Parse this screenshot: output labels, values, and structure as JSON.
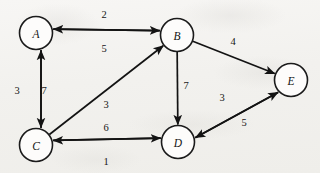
{
  "figure": {
    "background_color": "#f2f1ee",
    "ink_color": "#131313",
    "node_fill": "#fdfcfb"
  },
  "chart_data": {
    "type": "diagram",
    "diagram_kind": "directed-weighted-graph",
    "title": "",
    "directed": true,
    "weighted": true,
    "node_radius": 16.5,
    "nodes": [
      {
        "id": "A",
        "label": "A",
        "x": 36,
        "y": 33
      },
      {
        "id": "B",
        "label": "B",
        "x": 177,
        "y": 35
      },
      {
        "id": "C",
        "label": "C",
        "x": 36,
        "y": 145
      },
      {
        "id": "D",
        "label": "D",
        "x": 178,
        "y": 142
      },
      {
        "id": "E",
        "label": "E",
        "x": 291,
        "y": 80
      }
    ],
    "edges": [
      {
        "from": "A",
        "to": "B",
        "weight": 2,
        "label_x": 104,
        "label_y": 14
      },
      {
        "from": "B",
        "to": "A",
        "weight": 5,
        "label_x": 104,
        "label_y": 48
      },
      {
        "from": "A",
        "to": "C",
        "weight": 3,
        "label_x": 17,
        "label_y": 90
      },
      {
        "from": "C",
        "to": "A",
        "weight": 7,
        "label_x": 44,
        "label_y": 90
      },
      {
        "from": "C",
        "to": "B",
        "weight": 3,
        "label_x": 106,
        "label_y": 104
      },
      {
        "from": "B",
        "to": "D",
        "weight": 7,
        "label_x": 186,
        "label_y": 85
      },
      {
        "from": "B",
        "to": "E",
        "weight": 4,
        "label_x": 233,
        "label_y": 41
      },
      {
        "from": "C",
        "to": "D",
        "weight": 6,
        "label_x": 106,
        "label_y": 127
      },
      {
        "from": "D",
        "to": "C",
        "weight": 1,
        "label_x": 106,
        "label_y": 161
      },
      {
        "from": "E",
        "to": "D",
        "weight": 3,
        "label_x": 222,
        "label_y": 97
      },
      {
        "from": "D",
        "to": "E",
        "weight": 5,
        "label_x": 244,
        "label_y": 122
      }
    ],
    "adjacency_summary": [
      "A -2-> B",
      "B -5-> A",
      "A -3-> C",
      "C -7-> A",
      "C -3-> B",
      "B -7-> D",
      "B -4-> E",
      "C -6-> D",
      "D -1-> C",
      "E -3-> D",
      "D -5-> E"
    ],
    "node_labels": [
      "A",
      "B",
      "C",
      "D",
      "E"
    ],
    "weights": [
      2,
      5,
      3,
      7,
      3,
      7,
      4,
      6,
      1,
      3,
      5
    ]
  }
}
